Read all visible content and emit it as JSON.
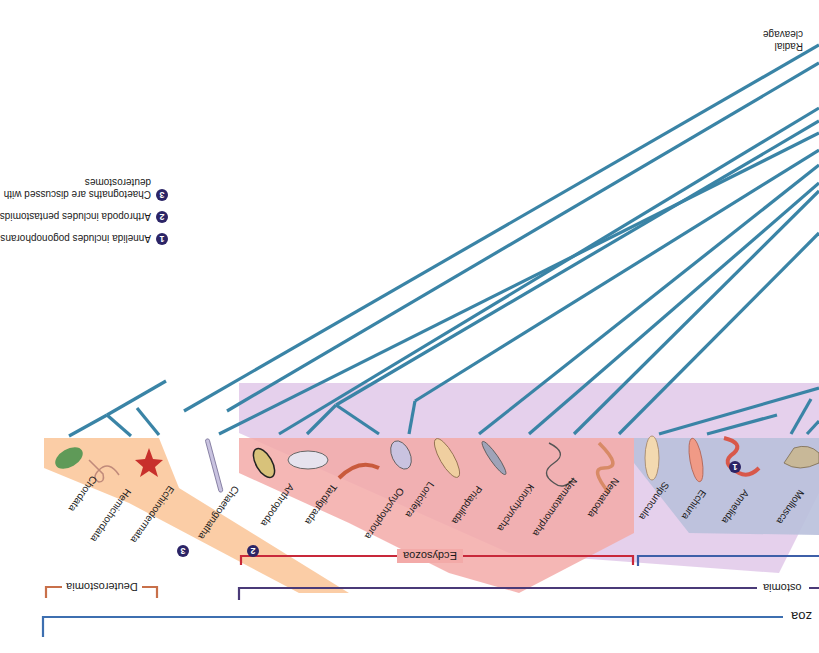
{
  "figure": {
    "orientation": "rotated-180",
    "colors": {
      "branch": "#3a84a6",
      "deuterostomia_bg": "#fac9a0",
      "ecdysozoa_bg": "#f2a9a6",
      "lophotrochozoa_bg": "#b9bfdc",
      "protostomia_bg": "#d9b4dc",
      "deuterostomia_bracket": "#c8704a",
      "ecdysozoa_bracket": "#c8283a",
      "lophotrochozoa_bracket": "#3d5fa8",
      "protostomia_bracket": "#4a3a78",
      "bilateria_bracket": "#3d6fb0",
      "badge": "#2b2466"
    },
    "character_label": "Radial cleavage",
    "character_label_lines": [
      "Radial",
      "cleavage"
    ],
    "notes": [
      {
        "badge": "1",
        "text": "Annelida includes pogonophorans"
      },
      {
        "badge": "2",
        "text": "Arthropoda includes pentastomids"
      },
      {
        "badge": "3",
        "lines": [
          "Chaetognaths are discussed with",
          "deuterostomes"
        ]
      }
    ],
    "taxa": [
      {
        "name": "Mollusca",
        "group": "Lophotrochozoa"
      },
      {
        "name": "Annelida",
        "group": "Lophotrochozoa",
        "badge": "1"
      },
      {
        "name": "Echiura",
        "group": "Lophotrochozoa"
      },
      {
        "name": "Sipuncula",
        "group": "Lophotrochozoa"
      },
      {
        "name": "Nematoda",
        "group": "Ecdysozoa"
      },
      {
        "name": "Nematomorpha",
        "group": "Ecdysozoa"
      },
      {
        "name": "Kinorhyncha",
        "group": "Ecdysozoa"
      },
      {
        "name": "Priapulida",
        "group": "Ecdysozoa"
      },
      {
        "name": "Loricifera",
        "group": "Ecdysozoa"
      },
      {
        "name": "Onychophora",
        "group": "Ecdysozoa"
      },
      {
        "name": "Tardigrada",
        "group": "Ecdysozoa"
      },
      {
        "name": "Arthropoda",
        "group": "Ecdysozoa",
        "badge": "2"
      },
      {
        "name": "Chaetognatha",
        "group": "none",
        "badge": "3"
      },
      {
        "name": "Echinodermata",
        "group": "Deuterostomia"
      },
      {
        "name": "Hemichordata",
        "group": "Deuterostomia"
      },
      {
        "name": "Chordata",
        "group": "Deuterostomia"
      }
    ],
    "groups": {
      "ecdysozoa": "Ecdysozoa",
      "deuterostomia": "Deuterostomia",
      "protostomia_partial": "ostomia",
      "bilateria_partial": "zoa"
    }
  }
}
